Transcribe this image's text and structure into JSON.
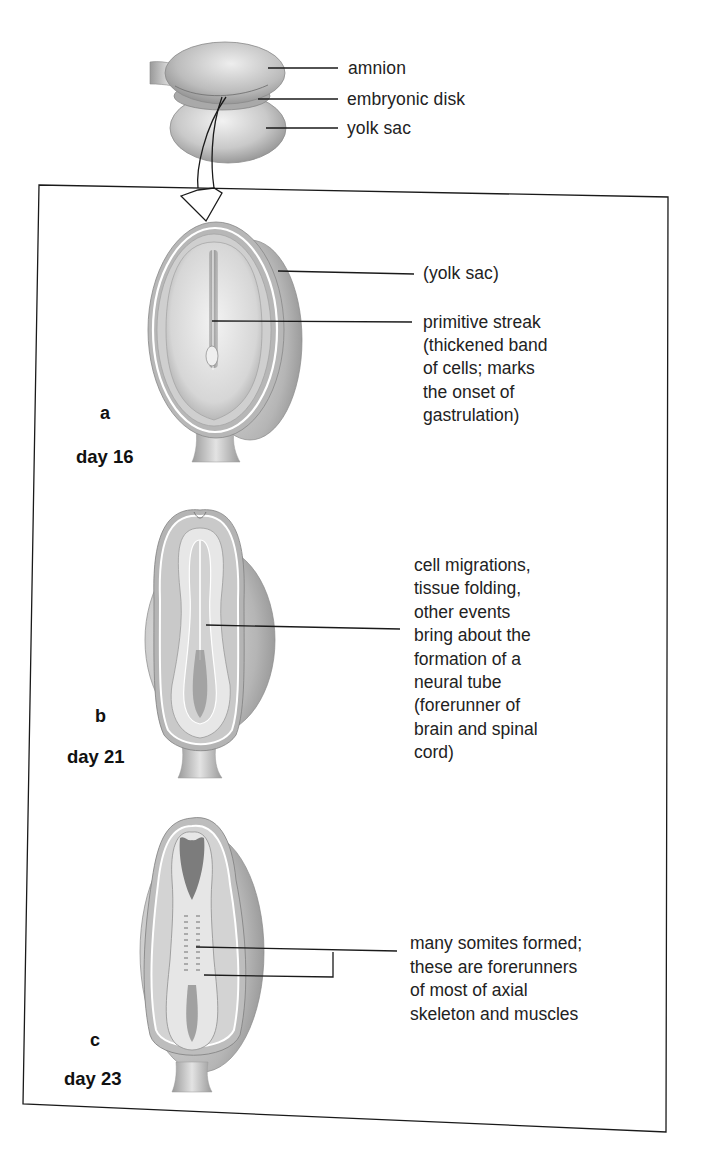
{
  "top_illustration": {
    "labels": [
      {
        "id": "amnion",
        "text": "amnion"
      },
      {
        "id": "embryonic-disk",
        "text": "embryonic disk"
      },
      {
        "id": "yolk-sac",
        "text": "yolk sac"
      }
    ]
  },
  "stages": [
    {
      "letter": "a",
      "day": "day 16",
      "callouts": [
        {
          "lines": [
            "(yolk sac)"
          ]
        },
        {
          "lines": [
            "primitive streak",
            "(thickened band",
            "of cells; marks",
            "the onset of",
            "gastrulation)"
          ]
        }
      ]
    },
    {
      "letter": "b",
      "day": "day 21",
      "callouts": [
        {
          "lines": [
            "cell migrations,",
            "tissue folding,",
            "other events",
            "bring about the",
            "formation of a",
            "neural tube",
            "(forerunner of",
            "brain and spinal",
            "cord)"
          ]
        }
      ]
    },
    {
      "letter": "c",
      "day": "day 23",
      "callouts": [
        {
          "lines": [
            "many somites formed;",
            "these are forerunners",
            "of most of axial",
            "skeleton and muscles"
          ]
        }
      ]
    }
  ],
  "colors": {
    "line": "#1a1a1a",
    "tissue_light": "#e6e6e6",
    "tissue_mid": "#bdbdbd",
    "tissue_dark": "#8a8a8a"
  }
}
